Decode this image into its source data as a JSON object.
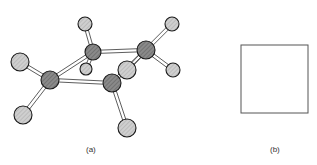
{
  "figure": {
    "panel_a": {
      "label": "(a)",
      "description": "ball-and-stick molecule, chair-like ring of 4 dark atoms with 8 light substituent atoms",
      "atoms": [
        {
          "id": "c1",
          "x": 50,
          "y": 80,
          "r": 9,
          "kind": "dark"
        },
        {
          "id": "c2",
          "x": 93,
          "y": 52,
          "r": 8,
          "kind": "dark"
        },
        {
          "id": "c3",
          "x": 146,
          "y": 50,
          "r": 9,
          "kind": "dark"
        },
        {
          "id": "c4",
          "x": 112,
          "y": 83,
          "r": 9,
          "kind": "dark"
        },
        {
          "id": "h1",
          "x": 20,
          "y": 62,
          "r": 9,
          "kind": "light"
        },
        {
          "id": "h2",
          "x": 23,
          "y": 115,
          "r": 9,
          "kind": "light"
        },
        {
          "id": "h3",
          "x": 85,
          "y": 24,
          "r": 7,
          "kind": "light"
        },
        {
          "id": "h4",
          "x": 86,
          "y": 69,
          "r": 6,
          "kind": "light"
        },
        {
          "id": "h5",
          "x": 172,
          "y": 24,
          "r": 7,
          "kind": "light"
        },
        {
          "id": "h6",
          "x": 173,
          "y": 70,
          "r": 7,
          "kind": "light"
        },
        {
          "id": "h7",
          "x": 127,
          "y": 70,
          "r": 9,
          "kind": "light"
        },
        {
          "id": "h8",
          "x": 127,
          "y": 128,
          "r": 9,
          "kind": "light"
        }
      ],
      "bonds": [
        [
          "c1",
          "c2"
        ],
        [
          "c2",
          "c3"
        ],
        [
          "c1",
          "c4"
        ],
        [
          "c3",
          "c4"
        ],
        [
          "c1",
          "h1"
        ],
        [
          "c1",
          "h2"
        ],
        [
          "c2",
          "h3"
        ],
        [
          "c2",
          "h4"
        ],
        [
          "c3",
          "h5"
        ],
        [
          "c3",
          "h6"
        ],
        [
          "c3",
          "h7"
        ],
        [
          "c4",
          "h8"
        ]
      ]
    },
    "panel_b": {
      "label": "(b)",
      "shape": "square",
      "x": 241,
      "y": 45,
      "w": 67,
      "h": 68
    },
    "colors": {
      "dark_atom": "#8a8a8a",
      "light_atom": "#c8c8c8",
      "outline": "#1a1a1a",
      "bond": "#333333"
    }
  }
}
